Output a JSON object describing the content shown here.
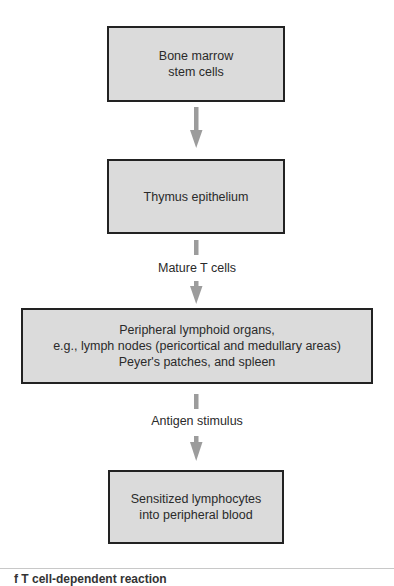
{
  "diagram": {
    "type": "flowchart",
    "direction": "top-to-bottom",
    "colors": {
      "box_fill": "#dbdbdb",
      "box_border": "#222222",
      "arrow": "#9c9c9c",
      "text": "#2a2a2a"
    },
    "nodes": [
      {
        "id": "bone-marrow",
        "lines": [
          "Bone marrow",
          "stem cells"
        ]
      },
      {
        "id": "thymus",
        "lines": [
          "Thymus epithelium"
        ]
      },
      {
        "id": "peripheral-lymphoid",
        "lines": [
          "Peripheral lymphoid organs,",
          "e.g., lymph nodes (pericortical and medullary areas)",
          "Peyer's patches, and spleen"
        ]
      },
      {
        "id": "sensitized-lymphocytes",
        "lines": [
          "Sensitized lymphocytes",
          "into peripheral blood"
        ]
      }
    ],
    "edges": [
      {
        "from": "bone-marrow",
        "to": "thymus",
        "label": ""
      },
      {
        "from": "thymus",
        "to": "peripheral-lymphoid",
        "label": "Mature T cells"
      },
      {
        "from": "peripheral-lymphoid",
        "to": "sensitized-lymphocytes",
        "label": "Antigen stimulus"
      }
    ]
  },
  "caption": {
    "text": "f T cell-dependent reaction"
  }
}
